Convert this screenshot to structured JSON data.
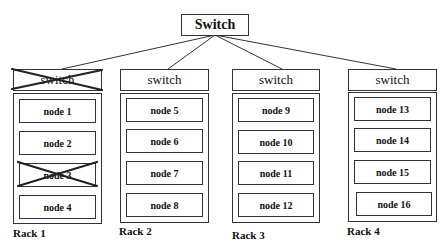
{
  "diagram": {
    "core_switch": {
      "label": "Switch"
    },
    "racks": [
      {
        "label": "Rack 1",
        "switch": {
          "label": "switch",
          "failed": true
        },
        "nodes": [
          {
            "label": "node 1",
            "failed": false
          },
          {
            "label": "node 2",
            "failed": false
          },
          {
            "label": "node 3",
            "failed": true
          },
          {
            "label": "node 4",
            "failed": false
          }
        ]
      },
      {
        "label": "Rack 2",
        "switch": {
          "label": "switch",
          "failed": false
        },
        "nodes": [
          {
            "label": "node 5",
            "failed": false
          },
          {
            "label": "node 6",
            "failed": false
          },
          {
            "label": "node 7",
            "failed": false
          },
          {
            "label": "node 8",
            "failed": false
          }
        ]
      },
      {
        "label": "Rack 3",
        "switch": {
          "label": "switch",
          "failed": false
        },
        "nodes": [
          {
            "label": "node 9",
            "failed": false
          },
          {
            "label": "node 10",
            "failed": false
          },
          {
            "label": "node 11",
            "failed": false
          },
          {
            "label": "node 12",
            "failed": false
          }
        ]
      },
      {
        "label": "Rack 4",
        "switch": {
          "label": "switch",
          "failed": false
        },
        "nodes": [
          {
            "label": "node 13",
            "failed": false
          },
          {
            "label": "node 14",
            "failed": false
          },
          {
            "label": "node 15",
            "failed": false
          },
          {
            "label": "node 16",
            "failed": false
          }
        ]
      }
    ]
  }
}
